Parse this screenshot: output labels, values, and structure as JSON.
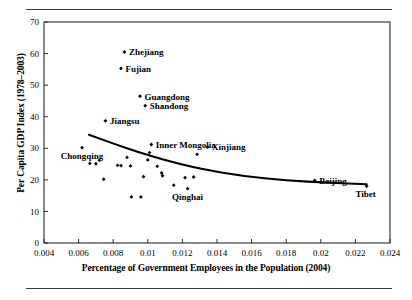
{
  "figure": {
    "y_axis_title": "Per Capita GDP Index (1978–2003)",
    "x_axis_title": "Percentage of Government Employees in the Population (2004)"
  },
  "chart_data": {
    "type": "scatter",
    "title": "",
    "xlabel": "Percentage of Government Employees in the Population (2004)",
    "ylabel": "Per Capita GDP Index (1978–2003)",
    "xlim": [
      0.004,
      0.024
    ],
    "ylim": [
      0,
      70
    ],
    "xticks": [
      0.004,
      0.006,
      0.008,
      0.01,
      0.012,
      0.014,
      0.016,
      0.018,
      0.02,
      0.022,
      0.024
    ],
    "xtick_labels": [
      "0.004",
      "0.006",
      "0.008",
      "0.01",
      "0.012",
      "0.014",
      "0.016",
      "0.018",
      "0.02",
      "0.022",
      "0.024"
    ],
    "yticks": [
      0,
      10,
      20,
      30,
      40,
      50,
      60,
      70
    ],
    "ytick_labels": [
      "0",
      "10",
      "20",
      "30",
      "40",
      "50",
      "60",
      "70"
    ],
    "grid": false,
    "legend": null,
    "marker": "diamond",
    "marker_color": "#000000",
    "points": [
      {
        "label": "Zhejiang",
        "x": 0.00865,
        "y": 60.5,
        "label_pos": "right"
      },
      {
        "label": "Fujian",
        "x": 0.00845,
        "y": 55.3,
        "label_pos": "right"
      },
      {
        "label": "Guangdong",
        "x": 0.00955,
        "y": 46.5,
        "label_pos": "right"
      },
      {
        "label": "Shandong",
        "x": 0.00985,
        "y": 43.5,
        "label_pos": "right"
      },
      {
        "label": "Jiangsu",
        "x": 0.00755,
        "y": 38.7,
        "label_pos": "right"
      },
      {
        "label": "Inner Mongolia",
        "x": 0.0102,
        "y": 31.2,
        "label_pos": "right"
      },
      {
        "label": "Xinjiang",
        "x": 0.01345,
        "y": 30.4,
        "label_pos": "right"
      },
      {
        "label": "Beijing",
        "x": 0.01965,
        "y": 19.8,
        "label_pos": "right"
      },
      {
        "label": "Tibet",
        "x": 0.02265,
        "y": 18.0,
        "label_pos": "below-right"
      },
      {
        "label": "Chongqing",
        "x": 0.0062,
        "y": 30.2,
        "label_pos": "below"
      },
      {
        "label": "Qinghai",
        "x": 0.0123,
        "y": 17.2,
        "label_pos": "below"
      },
      {
        "label": "",
        "x": 0.00665,
        "y": 25.2
      },
      {
        "label": "",
        "x": 0.007,
        "y": 25.1
      },
      {
        "label": "",
        "x": 0.0072,
        "y": 26.2
      },
      {
        "label": "",
        "x": 0.00745,
        "y": 20.2
      },
      {
        "label": "",
        "x": 0.00825,
        "y": 24.6
      },
      {
        "label": "",
        "x": 0.00845,
        "y": 24.5
      },
      {
        "label": "",
        "x": 0.0088,
        "y": 27.1
      },
      {
        "label": "",
        "x": 0.009,
        "y": 24.4
      },
      {
        "label": "",
        "x": 0.00905,
        "y": 14.6
      },
      {
        "label": "",
        "x": 0.0096,
        "y": 14.6
      },
      {
        "label": "",
        "x": 0.00975,
        "y": 21.0
      },
      {
        "label": "",
        "x": 0.01,
        "y": 26.3
      },
      {
        "label": "",
        "x": 0.0101,
        "y": 28.6
      },
      {
        "label": "",
        "x": 0.01055,
        "y": 24.3
      },
      {
        "label": "",
        "x": 0.0108,
        "y": 22.2
      },
      {
        "label": "",
        "x": 0.01085,
        "y": 21.3
      },
      {
        "label": "",
        "x": 0.0115,
        "y": 18.3
      },
      {
        "label": "",
        "x": 0.01215,
        "y": 20.7
      },
      {
        "label": "",
        "x": 0.01265,
        "y": 20.9
      },
      {
        "label": "",
        "x": 0.01285,
        "y": 28.1
      }
    ],
    "trend_line": {
      "type": "fitted-curve",
      "color": "#000000",
      "points": [
        {
          "x": 0.0066,
          "y": 34.3
        },
        {
          "x": 0.008,
          "y": 31.5
        },
        {
          "x": 0.0095,
          "y": 28.7
        },
        {
          "x": 0.011,
          "y": 26.2
        },
        {
          "x": 0.013,
          "y": 23.5
        },
        {
          "x": 0.0155,
          "y": 21.2
        },
        {
          "x": 0.018,
          "y": 19.8
        },
        {
          "x": 0.0205,
          "y": 19.1
        },
        {
          "x": 0.02265,
          "y": 18.6
        }
      ]
    }
  }
}
